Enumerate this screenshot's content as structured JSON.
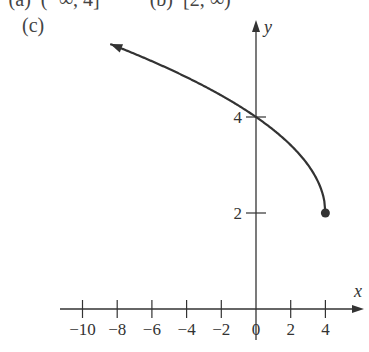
{
  "header": {
    "top_line": "' (a)  (−∞, 4]          (b)  [2, ∞)",
    "part_label": "(c)"
  },
  "chart_data": {
    "type": "line",
    "title": "",
    "function": "y = √(4 − x) + 2",
    "xlabel": "x",
    "ylabel": "y",
    "x_ticks": [
      -10,
      -8,
      -6,
      -4,
      -2,
      0,
      2,
      4
    ],
    "x_tick_labels": [
      "−10",
      "−8",
      "−6",
      "−4",
      "−2",
      "0",
      "2",
      "4"
    ],
    "y_ticks": [
      2,
      4
    ],
    "y_tick_labels": [
      "2",
      "4"
    ],
    "series": [
      {
        "name": "curve",
        "x": [
          -8.4,
          -8,
          -6,
          -4,
          -2,
          0,
          2,
          3,
          3.5,
          4
        ],
        "y": [
          5.52,
          5.46,
          5.16,
          4.83,
          4.45,
          4.0,
          3.41,
          3.0,
          2.71,
          2.0
        ],
        "endpoint": {
          "x": 4,
          "y": 2,
          "style": "closed-dot"
        },
        "arrow": "left"
      }
    ],
    "xlim": [
      -10.5,
      6
    ],
    "ylim": [
      0,
      6
    ],
    "grid": false,
    "legend": null
  }
}
